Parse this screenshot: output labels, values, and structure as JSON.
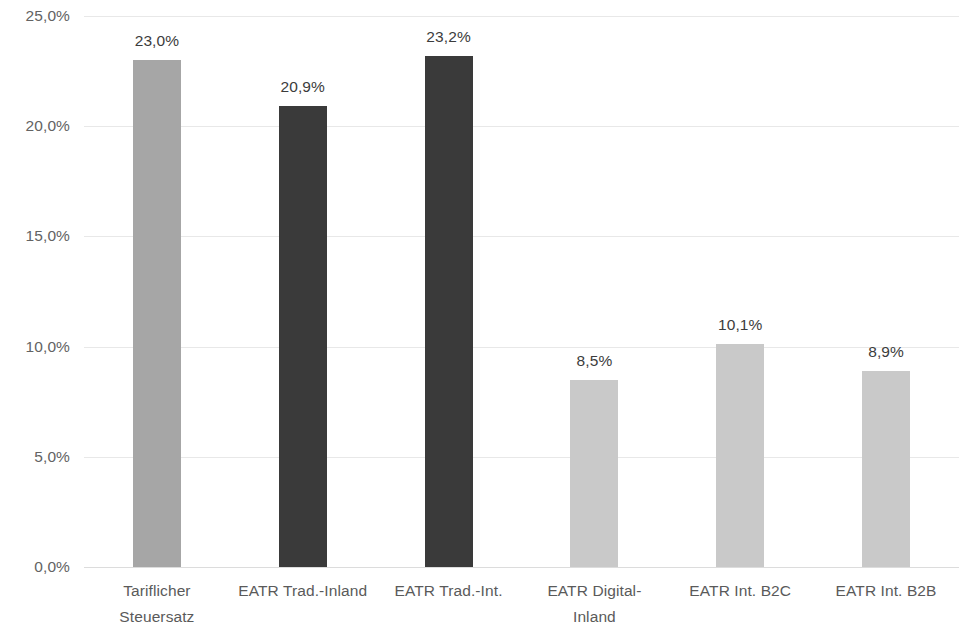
{
  "chart_data": {
    "type": "bar",
    "title": "",
    "subtitle": "",
    "xlabel": "",
    "ylabel": "",
    "ylim": [
      0,
      25
    ],
    "ytick_values": [
      25.0,
      20.0,
      15.0,
      10.0,
      5.0,
      0.0
    ],
    "ytick_labels": [
      "25,0%",
      "20,0%",
      "15,0%",
      "10,0%",
      "5,0%",
      "0,0%"
    ],
    "grid": true,
    "legend": false,
    "legend_position": "none",
    "categories": [
      "Tariflicher\nSteuersatz",
      "EATR Trad.-Inland",
      "EATR Trad.-Int.",
      "EATR Digital-\nInland",
      "EATR Int. B2C",
      "EATR Int. B2B"
    ],
    "values": [
      23.0,
      20.9,
      23.2,
      8.5,
      10.1,
      8.9
    ],
    "data_labels": [
      "23,0%",
      "20,9%",
      "23,2%",
      "8,5%",
      "10,1%",
      "8,9%"
    ],
    "bar_colors": [
      "#a6a6a6",
      "#3a3a3a",
      "#3a3a3a",
      "#c9c9c9",
      "#c9c9c9",
      "#c9c9c9"
    ],
    "gridline_color": "#e8e8e8",
    "background_color": "#ffffff",
    "axis_text_color": "#5a5a5a",
    "data_label_color": "#3c3c3c"
  }
}
